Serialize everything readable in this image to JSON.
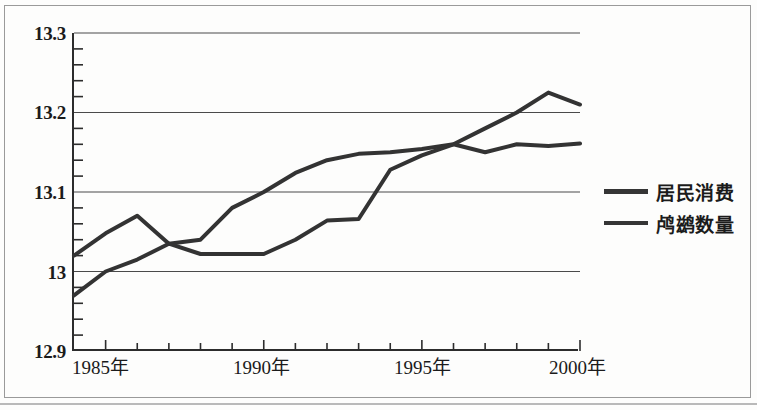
{
  "figure": {
    "background_color": "#fdfdfc",
    "frame_color": "#9a9a9a"
  },
  "chart_data": {
    "type": "line",
    "title": "",
    "subtitle": "",
    "xlabel": "",
    "ylabel": "",
    "xlim": [
      1984,
      2000
    ],
    "ylim": [
      12.9,
      13.3
    ],
    "grid": true,
    "grid_axis": "y",
    "legend_position": "right",
    "y_ticks": [
      "12.9",
      "13",
      "13.1",
      "13.2",
      "13.3"
    ],
    "y_tick_values": [
      12.9,
      13.0,
      13.1,
      13.2,
      13.3
    ],
    "y_minor_tick_step": 0.02,
    "x_ticks": [
      "1985年",
      "1990年",
      "1995年",
      "2000年"
    ],
    "x_tick_values": [
      1985,
      1990,
      1995,
      2000
    ],
    "x": [
      1984,
      1985,
      1986,
      1987,
      1988,
      1989,
      1990,
      1991,
      1992,
      1993,
      1994,
      1995,
      1996,
      1997,
      1998,
      1999,
      2000
    ],
    "series": [
      {
        "name": "居民消费",
        "color": "#333333",
        "line_width": 4,
        "values": [
          13.02,
          13.048,
          13.07,
          13.035,
          13.04,
          13.08,
          13.1,
          13.124,
          13.14,
          13.148,
          13.15,
          13.154,
          13.16,
          13.18,
          13.2,
          13.225,
          13.21
        ]
      },
      {
        "name": "鸬鹚数量",
        "color": "#333333",
        "line_width": 4,
        "values": [
          12.97,
          13.0,
          13.015,
          13.035,
          13.022,
          13.022,
          13.022,
          13.04,
          13.064,
          13.066,
          13.128,
          13.146,
          13.16,
          13.15,
          13.16,
          13.158,
          13.161
        ]
      }
    ]
  },
  "legend": {
    "items": [
      {
        "label": "居民消费"
      },
      {
        "label": "鸬鹚数量"
      }
    ]
  },
  "axes": {
    "y_labels": [
      "13.3",
      "13.2",
      "13.1",
      "13",
      "12.9"
    ],
    "x_labels": [
      "1985年",
      "1990年",
      "1995年",
      "2000年"
    ]
  }
}
